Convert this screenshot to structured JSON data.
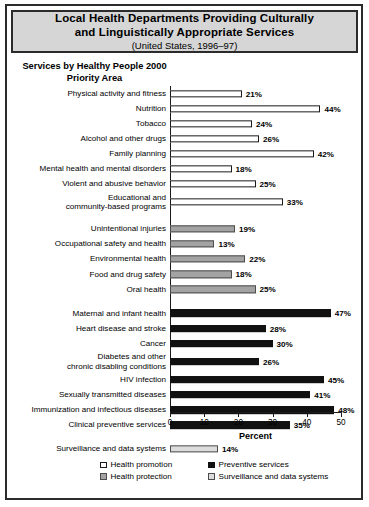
{
  "title": {
    "line1": "Local Health Departments Providing Culturally",
    "line2": "and Linguistically Appropriate Services",
    "subtitle": "(United States, 1996–97)"
  },
  "chart_heading": "Services by Healthy People\n2000 Priority Area",
  "legend": {
    "items": [
      {
        "label": "Health promotion",
        "key": "promotion",
        "color": "#ffffff"
      },
      {
        "label": "Preventive services",
        "key": "preventive",
        "color": "#111111"
      },
      {
        "label": "Health protection",
        "key": "protection",
        "color": "#a3a3a3"
      },
      {
        "label": "Surveillance and data systems",
        "key": "surveillance",
        "color": "#dcdcdc"
      }
    ]
  },
  "chart_data": {
    "type": "bar",
    "orientation": "horizontal",
    "title": "Local Health Departments Providing Culturally and Linguistically Appropriate Services",
    "subtitle": "(United States, 1996–97)",
    "group_title": "Services by Healthy People 2000 Priority Area",
    "xlabel": "Percent",
    "ylabel": "",
    "xlim": [
      0,
      50
    ],
    "xticks": [
      0,
      10,
      20,
      30,
      40,
      50
    ],
    "xtick_labels": [
      "0",
      "10",
      "20",
      "30",
      "40",
      "50"
    ],
    "grid": false,
    "legend_position": "bottom",
    "series": [
      {
        "name": "Health promotion",
        "color": "#ffffff"
      },
      {
        "name": "Health protection",
        "color": "#a3a3a3"
      },
      {
        "name": "Preventive services",
        "color": "#111111"
      },
      {
        "name": "Surveillance and data systems",
        "color": "#dcdcdc"
      }
    ],
    "categories": [
      "Physical activity and fitness",
      "Nutrition",
      "Tobacco",
      "Alcohol and other drugs",
      "Family planning",
      "Mental health and mental disorders",
      "Violent and abusive behavior",
      "Educational and community-based programs",
      "Unintentional injuries",
      "Occupational safety and health",
      "Environmental health",
      "Food and drug safety",
      "Oral health",
      "Maternal and infant health",
      "Heart disease and stroke",
      "Cancer",
      "Diabetes and other chronic disabling conditions",
      "HIV infection",
      "Sexually transmitted diseases",
      "Immunization and infectious diseases",
      "Clinical preventive services",
      "Surveillance and data systems"
    ],
    "values": [
      21,
      44,
      24,
      26,
      42,
      18,
      25,
      33,
      19,
      13,
      22,
      18,
      25,
      47,
      28,
      30,
      26,
      45,
      41,
      48,
      35,
      14
    ],
    "bars": [
      {
        "label": "Physical activity and fitness",
        "label_lines": [
          "Physical activity and fitness"
        ],
        "value": 21,
        "value_label": "21%",
        "group": "promotion",
        "spacer_before": false
      },
      {
        "label": "Nutrition",
        "label_lines": [
          "Nutrition"
        ],
        "value": 44,
        "value_label": "44%",
        "group": "promotion",
        "spacer_before": false
      },
      {
        "label": "Tobacco",
        "label_lines": [
          "Tobacco"
        ],
        "value": 24,
        "value_label": "24%",
        "group": "promotion",
        "spacer_before": false
      },
      {
        "label": "Alcohol and other drugs",
        "label_lines": [
          "Alcohol and other drugs"
        ],
        "value": 26,
        "value_label": "26%",
        "group": "promotion",
        "spacer_before": false
      },
      {
        "label": "Family planning",
        "label_lines": [
          "Family planning"
        ],
        "value": 42,
        "value_label": "42%",
        "group": "promotion",
        "spacer_before": false
      },
      {
        "label": "Mental health and mental disorders",
        "label_lines": [
          "Mental health and mental disorders"
        ],
        "value": 18,
        "value_label": "18%",
        "group": "promotion",
        "spacer_before": false
      },
      {
        "label": "Violent and abusive behavior",
        "label_lines": [
          "Violent and abusive behavior"
        ],
        "value": 25,
        "value_label": "25%",
        "group": "promotion",
        "spacer_before": false
      },
      {
        "label": "Educational and community-based programs",
        "label_lines": [
          "Educational and",
          "community-based programs"
        ],
        "value": 33,
        "value_label": "33%",
        "group": "promotion",
        "spacer_before": false,
        "tall": true
      },
      {
        "label": "Unintentional injuries",
        "label_lines": [
          "Unintentional injuries"
        ],
        "value": 19,
        "value_label": "19%",
        "group": "protection",
        "spacer_before": true
      },
      {
        "label": "Occupational safety and health",
        "label_lines": [
          "Occupational safety and health"
        ],
        "value": 13,
        "value_label": "13%",
        "group": "protection",
        "spacer_before": false
      },
      {
        "label": "Environmental health",
        "label_lines": [
          "Environmental health"
        ],
        "value": 22,
        "value_label": "22%",
        "group": "protection",
        "spacer_before": false
      },
      {
        "label": "Food and drug safety",
        "label_lines": [
          "Food and drug safety"
        ],
        "value": 18,
        "value_label": "18%",
        "group": "protection",
        "spacer_before": false
      },
      {
        "label": "Oral health",
        "label_lines": [
          "Oral health"
        ],
        "value": 25,
        "value_label": "25%",
        "group": "protection",
        "spacer_before": false
      },
      {
        "label": "Maternal and infant health",
        "label_lines": [
          "Maternal and infant health"
        ],
        "value": 47,
        "value_label": "47%",
        "group": "preventive",
        "spacer_before": true
      },
      {
        "label": "Heart disease and stroke",
        "label_lines": [
          "Heart disease and stroke"
        ],
        "value": 28,
        "value_label": "28%",
        "group": "preventive",
        "spacer_before": false
      },
      {
        "label": "Cancer",
        "label_lines": [
          "Cancer"
        ],
        "value": 30,
        "value_label": "30%",
        "group": "preventive",
        "spacer_before": false
      },
      {
        "label": "Diabetes and other chronic disabling conditions",
        "label_lines": [
          "Diabetes and other",
          "chronic disabling conditions"
        ],
        "value": 26,
        "value_label": "26%",
        "group": "preventive",
        "spacer_before": false,
        "tall": true
      },
      {
        "label": "HIV infection",
        "label_lines": [
          "HIV infection"
        ],
        "value": 45,
        "value_label": "45%",
        "group": "preventive",
        "spacer_before": false
      },
      {
        "label": "Sexually transmitted diseases",
        "label_lines": [
          "Sexually transmitted diseases"
        ],
        "value": 41,
        "value_label": "41%",
        "group": "preventive",
        "spacer_before": false
      },
      {
        "label": "Immunization and infectious diseases",
        "label_lines": [
          "Immunization and infectious diseases"
        ],
        "value": 48,
        "value_label": "48%",
        "group": "preventive",
        "spacer_before": false
      },
      {
        "label": "Clinical preventive services",
        "label_lines": [
          "Clinical preventive services"
        ],
        "value": 35,
        "value_label": "35%",
        "group": "preventive",
        "spacer_before": false
      },
      {
        "label": "Surveillance and data systems",
        "label_lines": [
          "Surveillance and data systems"
        ],
        "value": 14,
        "value_label": "14%",
        "group": "surveillance",
        "spacer_before": true
      }
    ]
  }
}
